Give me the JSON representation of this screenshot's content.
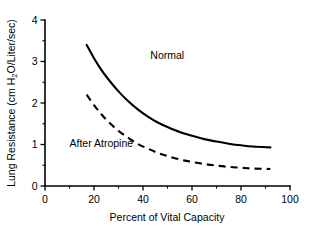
{
  "chart_data": {
    "type": "line",
    "title": "",
    "xlabel": "Percent of Vital Capacity",
    "ylabel_prefix": "Lung Resistance (cm H",
    "ylabel_subscript": "2",
    "ylabel_suffix": "O/Liter/sec)",
    "ylabel": "Lung Resistance (cm H2O/Liter/sec)",
    "xlim": [
      0,
      100
    ],
    "ylim": [
      0,
      4
    ],
    "grid": false,
    "legend_position": "inline-annotation",
    "xticks": [
      0,
      20,
      40,
      60,
      80,
      100
    ],
    "xtick_labels": [
      "0",
      "20",
      "40",
      "60",
      "80",
      "100"
    ],
    "xticks_minor": [
      10,
      30,
      50,
      70,
      90
    ],
    "yticks": [
      0,
      1,
      2,
      3,
      4
    ],
    "ytick_labels": [
      "0",
      "1",
      "2",
      "3",
      "4"
    ],
    "yticks_minor": [
      0.5,
      1.5,
      2.5,
      3.5
    ],
    "series": [
      {
        "name": "Normal",
        "style": "solid",
        "color": "#000000",
        "label_x": 43,
        "label_y": 3.05,
        "x": [
          17,
          20,
          23,
          26,
          30,
          34,
          38,
          42,
          46,
          50,
          55,
          60,
          65,
          70,
          75,
          80,
          85,
          92
        ],
        "values": [
          3.4,
          3.08,
          2.8,
          2.56,
          2.28,
          2.04,
          1.84,
          1.67,
          1.53,
          1.42,
          1.3,
          1.21,
          1.13,
          1.07,
          1.02,
          0.98,
          0.95,
          0.93
        ]
      },
      {
        "name": "After Atropine",
        "style": "dashed",
        "color": "#000000",
        "label_x": 10,
        "label_y": 0.93,
        "x": [
          17,
          20,
          23,
          26,
          30,
          34,
          38,
          42,
          46,
          50,
          55,
          60,
          65,
          70,
          75,
          80,
          85,
          92
        ],
        "values": [
          2.2,
          1.95,
          1.73,
          1.54,
          1.33,
          1.16,
          1.01,
          0.9,
          0.8,
          0.72,
          0.64,
          0.58,
          0.53,
          0.49,
          0.46,
          0.44,
          0.42,
          0.41
        ]
      }
    ]
  },
  "geometry": {
    "plot_left": 45,
    "plot_right": 290,
    "plot_bottom": 186,
    "plot_top": 20
  }
}
